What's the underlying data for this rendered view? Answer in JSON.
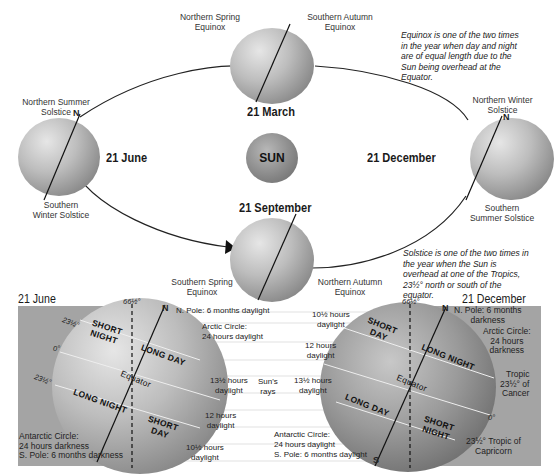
{
  "orbit": {
    "sun_label": "SUN",
    "positions": [
      {
        "date": "21 March",
        "top_label": "Northern Spring\nEquinox",
        "top_label_lines": [
          "Northern Spring",
          "Equinox"
        ],
        "right_label_lines": [
          "Southern Autumn",
          "Equinox"
        ]
      },
      {
        "date": "21 June",
        "top_label_lines": [
          "Northern Summer",
          "Solstice"
        ],
        "bottom_label_lines": [
          "Southern",
          "Winter Solstice"
        ],
        "pole": "N"
      },
      {
        "date": "21 September",
        "left_label_lines": [
          "Southern Spring",
          "Equinox"
        ],
        "right_label_lines": [
          "Northern Autumn",
          "Equinox"
        ]
      },
      {
        "date": "21 December",
        "top_label_lines": [
          "Northern Winter",
          "Solstice"
        ],
        "bottom_label_lines": [
          "Southern",
          "Summer Solstice"
        ],
        "pole": "N"
      }
    ],
    "labels": {
      "spring_n_1": "Northern Spring",
      "spring_n_2": "Equinox",
      "autumn_s_1": "Southern Autumn",
      "autumn_s_2": "Equinox",
      "summer_n_1": "Northern Summer",
      "summer_n_2": "Solstice",
      "winter_s_1": "Southern",
      "winter_s_2": "Winter Solstice",
      "winter_n_1": "Northern Winter",
      "winter_n_2": "Solstice",
      "summer_s_1": "Southern",
      "summer_s_2": "Summer Solstice",
      "spring_s_1": "Southern Spring",
      "spring_s_2": "Equinox",
      "autumn_n_1": "Northern Autumn",
      "autumn_n_2": "Equinox",
      "date_march": "21 March",
      "date_june": "21 June",
      "date_september": "21 September",
      "date_december": "21 December",
      "pole_n": "N"
    },
    "notes": {
      "equinox": [
        "Equinox is one of the two times",
        "in the year when day and night",
        "are of equal length due to the",
        "Sun being overhead at the",
        "Equator."
      ],
      "solstice": [
        "Solstice is one of the two times in",
        "the year when the Sun is",
        "overhead at one of the Tropics,",
        "23½° north or south of the",
        "equator."
      ]
    }
  },
  "detail": {
    "left": {
      "title": "21 June",
      "angle": "66½°",
      "pole_top": "N",
      "lat_labels": [
        "23½°",
        "0°",
        "23½°"
      ],
      "zones": [
        "SHORT NIGHT",
        "LONG DAY",
        "Equator",
        "LONG NIGHT",
        "SHORT DAY"
      ],
      "zone_short_night_1": "SHORT",
      "zone_short_night_2": "NIGHT",
      "zone_long_day": "LONG DAY",
      "zone_equator": "Equator",
      "zone_long_night": "LONG NIGHT",
      "zone_short_day_1": "SHORT",
      "zone_short_day_2": "DAY",
      "antarctic": [
        "Antarctic Circle:",
        "24 hours darkness",
        "S. Pole: 6 months darkness"
      ]
    },
    "right": {
      "title": "21 December",
      "angle": "66½°",
      "pole_top": "N",
      "pole_bottom": "S",
      "zone_short_day_1": "SHORT",
      "zone_short_day_2": "DAY",
      "zone_long_night": "LONG NIGHT",
      "zone_equator": "Equator",
      "zone_long_day": "LONG DAY",
      "zone_short_night_1": "SHORT",
      "zone_short_night_2": "NIGHT",
      "npole": [
        "N. Pole: 6 months",
        "darkness"
      ],
      "arctic": [
        "Arctic Circle:",
        "24 hours",
        "darkness"
      ],
      "cancer": [
        "Tropic",
        "23½° of",
        "Cancer"
      ],
      "zero": "0°",
      "capricorn": [
        "23½° Tropic of",
        "Capricorn"
      ]
    },
    "middle": {
      "left_column": {
        "npole": "N. Pole: 6 months daylight",
        "arctic": [
          "Arctic Circle:",
          "24 hours daylight"
        ],
        "tropic": [
          "13½ hours",
          "daylight"
        ],
        "equator": [
          "12 hours",
          "daylight"
        ],
        "south": [
          "10½ hours",
          "daylight"
        ]
      },
      "sun_rays": [
        "Sun's",
        "rays"
      ],
      "right_column": {
        "north": [
          "10½ hours",
          "daylight"
        ],
        "equator": [
          "12 hours",
          "daylight"
        ],
        "tropic": [
          "13½ hours",
          "daylight"
        ],
        "antarctic": [
          "Antarctic Circle:",
          "24 hours daylight"
        ],
        "spole": "S. Pole: 6 months daylight"
      }
    }
  }
}
